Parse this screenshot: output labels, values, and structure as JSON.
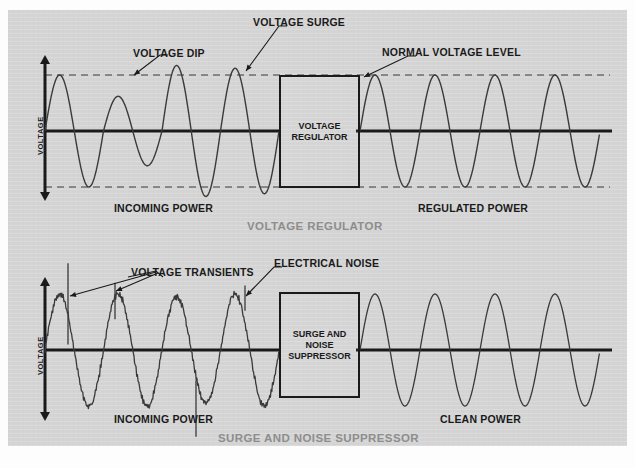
{
  "figure": {
    "background_color": "#d4d4d4",
    "ink_color": "#1a1a1a",
    "title_color": "#8d8d8d"
  },
  "panels": [
    {
      "id": "voltage-regulator",
      "title": "VOLTAGE REGULATOR",
      "axis_label": "VOLTAGE",
      "device_label_lines": [
        "VOLTAGE",
        "REGULATOR"
      ],
      "input_label": "INCOMING POWER",
      "output_label": "REGULATED POWER",
      "callouts": [
        {
          "name": "voltage-dip",
          "text": "VOLTAGE DIP"
        },
        {
          "name": "voltage-surge",
          "text": "VOLTAGE SURGE"
        },
        {
          "name": "normal-voltage-level",
          "text": "NORMAL VOLTAGE LEVEL"
        }
      ]
    },
    {
      "id": "surge-and-noise-suppressor",
      "title": "SURGE AND NOISE SUPPRESSOR",
      "axis_label": "VOLTAGE",
      "device_label_lines": [
        "SURGE AND",
        "NOISE",
        "SUPPRESSOR"
      ],
      "input_label": "INCOMING POWER",
      "output_label": "CLEAN POWER",
      "callouts": [
        {
          "name": "voltage-transients",
          "text": "VOLTAGE TRANSIENTS"
        },
        {
          "name": "electrical-noise",
          "text": "ELECTRICAL NOISE"
        }
      ]
    }
  ],
  "chart_data": {
    "type": "line",
    "xlabel": "",
    "ylabel": "VOLTAGE",
    "grid": false,
    "legend": "none",
    "charts": [
      {
        "name": "voltage-regulator",
        "title": "VOLTAGE REGULATOR",
        "reference_lines": {
          "zero": 0,
          "normal_high": 1.0,
          "normal_low": -1.0
        },
        "series": [
          {
            "name": "INCOMING POWER",
            "description": "Unregulated AC sine with one dip cycle and two surge cycles",
            "cycles": 4,
            "x_range": [
              45,
              279
            ],
            "amplitudes": [
              1.0,
              0.62,
              1.17,
              1.12
            ],
            "noise": 0,
            "transients": []
          },
          {
            "name": "REGULATED POWER",
            "description": "Clean AC sine at normal voltage level",
            "cycles": 4,
            "x_range": [
              360,
              600
            ],
            "amplitudes": [
              1.0,
              1.0,
              1.0,
              1.0
            ],
            "noise": 0,
            "transients": []
          }
        ]
      },
      {
        "name": "surge-and-noise-suppressor",
        "title": "SURGE AND NOISE SUPPRESSOR",
        "reference_lines": {
          "zero": 0
        },
        "series": [
          {
            "name": "INCOMING POWER",
            "description": "AC sine carrying high-frequency electrical noise plus voltage transient spikes",
            "cycles": 4,
            "x_range": [
              45,
              279
            ],
            "amplitudes": [
              1.0,
              1.0,
              0.95,
              1.0
            ],
            "noise": 0.07,
            "transients": [
              {
                "x": 68,
                "top": 1.55,
                "bottom": 0.1
              },
              {
                "x": 115,
                "top": 1.2,
                "bottom": 0.55
              },
              {
                "x": 196,
                "top": -0.55,
                "bottom": -1.55
              },
              {
                "x": 245,
                "top": 1.15,
                "bottom": 0.7
              }
            ]
          },
          {
            "name": "CLEAN POWER",
            "description": "Filtered AC sine free of noise and transients",
            "cycles": 4,
            "x_range": [
              360,
              600
            ],
            "amplitudes": [
              1.0,
              1.0,
              1.0,
              1.0
            ],
            "noise": 0,
            "transients": []
          }
        ]
      }
    ]
  },
  "geometry": {
    "panel_top": {
      "axis_x": 45,
      "axis_top": 56,
      "axis_bottom": 200,
      "zero_y": 131,
      "amp": 56,
      "dev_box": {
        "x": 279,
        "y": 75,
        "w": 81,
        "h": 113
      },
      "dash_top_y": 75,
      "dash_bottom_y": 187,
      "dash_x1": 45,
      "dash_x2": 610
    },
    "panel_bottom": {
      "axis_x": 45,
      "axis_top": 278,
      "axis_bottom": 420,
      "zero_y": 350,
      "amp": 56,
      "dev_box": {
        "x": 279,
        "y": 292,
        "w": 81,
        "h": 106
      }
    }
  }
}
